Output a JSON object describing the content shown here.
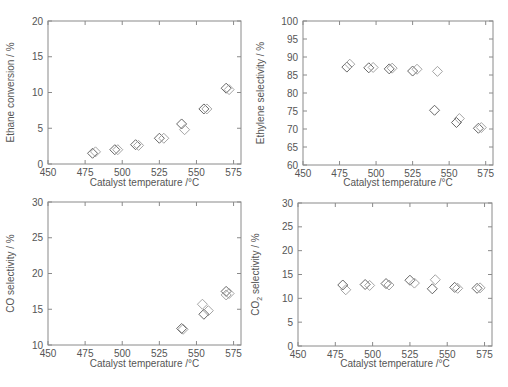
{
  "chart_data": [
    {
      "type": "scatter",
      "id": "ethane-conversion",
      "title": "",
      "xlabel": "Catalyst temperature /°C",
      "ylabel": "Ethane conversion / %",
      "xlim": [
        450,
        580
      ],
      "ylim": [
        0,
        20
      ],
      "xticks": [
        450,
        475,
        500,
        525,
        550,
        575
      ],
      "yticks": [
        0,
        5,
        10,
        15,
        20
      ],
      "grid": false,
      "marker": "diamond",
      "series": [
        {
          "name": "run-1",
          "color": "#555555",
          "x": [
            480,
            495,
            509,
            525,
            540,
            555,
            570
          ],
          "y": [
            1.5,
            2.0,
            2.7,
            3.6,
            5.6,
            7.7,
            10.6
          ]
        },
        {
          "name": "run-2",
          "color": "#9a9a9a",
          "x": [
            482,
            497,
            511,
            528,
            542,
            557,
            572
          ],
          "y": [
            1.7,
            2.0,
            2.6,
            3.6,
            4.8,
            7.7,
            10.4
          ]
        }
      ]
    },
    {
      "type": "scatter",
      "id": "ethylene-selectivity",
      "title": "",
      "xlabel": "Catalyst temperature /°C",
      "ylabel": "Ethylene selectivity / %",
      "xlim": [
        450,
        580
      ],
      "ylim": [
        60,
        100
      ],
      "xticks": [
        450,
        475,
        500,
        525,
        550,
        575
      ],
      "yticks": [
        60,
        65,
        70,
        75,
        80,
        85,
        90,
        95,
        100
      ],
      "grid": false,
      "marker": "diamond",
      "series": [
        {
          "name": "run-1",
          "color": "#555555",
          "x": [
            480,
            495,
            509,
            525,
            540,
            555,
            570
          ],
          "y": [
            87.2,
            87.0,
            86.7,
            86.1,
            75.2,
            71.8,
            70.2
          ]
        },
        {
          "name": "run-2",
          "color": "#9a9a9a",
          "x": [
            482,
            498,
            511,
            528,
            542,
            557,
            572
          ],
          "y": [
            88.0,
            87.1,
            86.9,
            86.6,
            86.0,
            72.9,
            70.4
          ]
        }
      ]
    },
    {
      "type": "scatter",
      "id": "co-selectivity",
      "title": "",
      "xlabel": "Catalyst temperature /°C",
      "ylabel": "CO selectivity / %",
      "xlim": [
        450,
        580
      ],
      "ylim": [
        10,
        30
      ],
      "xticks": [
        450,
        475,
        500,
        525,
        550,
        575
      ],
      "yticks": [
        10,
        15,
        20,
        25,
        30
      ],
      "grid": false,
      "marker": "diamond",
      "series": [
        {
          "name": "run-1",
          "color": "#555555",
          "x": [
            540,
            555,
            570
          ],
          "y": [
            12.3,
            14.3,
            17.5
          ]
        },
        {
          "name": "run-2",
          "color": "#9a9a9a",
          "x": [
            541,
            554,
            558,
            572,
            570
          ],
          "y": [
            12.2,
            15.7,
            14.8,
            17.2,
            17.0
          ]
        }
      ]
    },
    {
      "type": "scatter",
      "id": "co2-selectivity",
      "title": "",
      "xlabel": "Catalyst temperature /°C",
      "ylabel": "CO2 selectivity / %",
      "ylabel_main": "CO",
      "ylabel_sub": "2",
      "ylabel_rest": " selectivity / %",
      "xlim": [
        450,
        580
      ],
      "ylim": [
        0,
        30
      ],
      "xticks": [
        450,
        475,
        500,
        525,
        550,
        575
      ],
      "yticks": [
        0,
        5,
        10,
        15,
        20,
        25,
        30
      ],
      "grid": false,
      "marker": "diamond",
      "series": [
        {
          "name": "run-1",
          "color": "#555555",
          "x": [
            480,
            495,
            509,
            525,
            540,
            555,
            570
          ],
          "y": [
            12.8,
            12.9,
            13.1,
            13.8,
            12.0,
            12.3,
            12.1
          ]
        },
        {
          "name": "run-2",
          "color": "#9a9a9a",
          "x": [
            482,
            498,
            511,
            528,
            542,
            557,
            572
          ],
          "y": [
            11.8,
            12.7,
            12.8,
            13.2,
            13.9,
            12.1,
            12.2
          ]
        }
      ]
    }
  ]
}
